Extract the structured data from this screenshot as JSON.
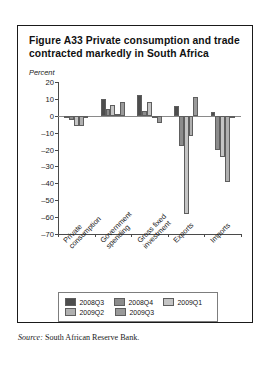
{
  "figure": {
    "title": "Figure A33  Private consumption and trade contracted markedly in South Africa",
    "unit_label": "Percent",
    "source_lead": "Source:",
    "source_text": " South African Reserve Bank."
  },
  "chart_data": {
    "type": "bar",
    "title": "Figure A33  Private consumption and trade contracted markedly in South Africa",
    "subtitle": "",
    "xlabel": "",
    "ylabel": "Percent",
    "ylim": [
      -70,
      20
    ],
    "ytick_values": [
      20,
      10,
      0,
      -10,
      -20,
      -30,
      -40,
      -50,
      -60,
      -70
    ],
    "ytick_labels": [
      "20",
      "10",
      "0",
      "–10",
      "–20",
      "–30",
      "–40",
      "–50",
      "–60",
      "–70"
    ],
    "grid": false,
    "legend_position": "bottom",
    "categories": [
      "Private consumption",
      "Government spending",
      "Gross fixed investment",
      "Exports",
      "Imports"
    ],
    "category_labels_wrapped": [
      "Private\nconsumption",
      "Government\nspending",
      "Gross fixed\ninvestment",
      "Exports",
      "Imports"
    ],
    "series": [
      {
        "name": "2008Q3",
        "color": "#4d4d4d",
        "values": [
          -1.0,
          10.0,
          12.5,
          5.8,
          2.5
        ]
      },
      {
        "name": "2008Q4",
        "color": "#8c8c8c",
        "values": [
          -2.5,
          4.0,
          3.0,
          -18.0,
          -20.5
        ]
      },
      {
        "name": "2009Q1",
        "color": "#c4c4c4",
        "values": [
          -6.0,
          6.5,
          8.0,
          -58.0,
          -24.5
        ]
      },
      {
        "name": "2009Q2",
        "color": "#b0b0b0",
        "values": [
          -6.0,
          1.0,
          -1.0,
          -12.0,
          -39.0
        ]
      },
      {
        "name": "2009Q3",
        "color": "#9a9a9a",
        "values": [
          -1.5,
          8.0,
          -4.0,
          11.0,
          -1.0
        ]
      }
    ]
  },
  "legend": {
    "rows": [
      [
        {
          "label": "2008Q3",
          "color": "#4d4d4d"
        },
        {
          "label": "2008Q4",
          "color": "#8c8c8c"
        },
        {
          "label": "2009Q1",
          "color": "#c4c4c4"
        }
      ],
      [
        {
          "label": "2009Q2",
          "color": "#b0b0b0"
        },
        {
          "label": "2009Q3",
          "color": "#9a9a9a"
        }
      ]
    ]
  }
}
